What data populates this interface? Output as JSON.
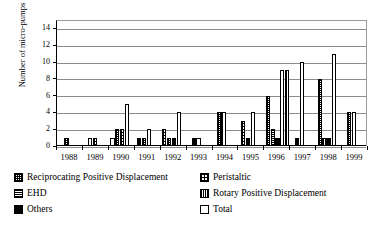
{
  "chart_data": {
    "type": "bar",
    "title": "",
    "xlabel": "",
    "ylabel": "Number of micro-pumps",
    "ylim": [
      0,
      15
    ],
    "yticks": [
      0,
      2,
      4,
      6,
      8,
      10,
      12,
      14
    ],
    "grid": true,
    "legend_position": "below",
    "categories": [
      "1988",
      "1989",
      "1990",
      "1991",
      "1992",
      "1993",
      "1994",
      "1995",
      "1996",
      "1997",
      "1998",
      "1999"
    ],
    "series": [
      {
        "name": "Reciprocating Positive Displacement",
        "key": "recip",
        "swatch": "checkered-light",
        "values": [
          1,
          1,
          2,
          1,
          2,
          1,
          4,
          4,
          6,
          10,
          8,
          4
        ]
      },
      {
        "name": "Peristaltic",
        "key": "peri",
        "swatch": "dotted",
        "values": [
          0,
          1,
          2,
          0,
          1,
          0,
          0,
          3,
          0,
          0,
          0,
          0
        ]
      },
      {
        "name": "EHD",
        "key": "ehd",
        "swatch": "dark-lines",
        "values": [
          0,
          0,
          0,
          0,
          0,
          0,
          0,
          0,
          2,
          9,
          1,
          0
        ]
      },
      {
        "name": "Rotary Positive Displacement",
        "key": "rotary",
        "swatch": "dark-dotted",
        "values": [
          0,
          0,
          0,
          0,
          0,
          0,
          0,
          0,
          1,
          9,
          1,
          0
        ]
      },
      {
        "name": "Others",
        "key": "others",
        "swatch": "solid-black",
        "values": [
          0,
          0,
          0,
          1,
          1,
          0,
          0,
          1,
          1,
          1,
          1,
          0
        ]
      },
      {
        "name": "Total",
        "key": "total",
        "swatch": "white",
        "values": [
          0,
          1,
          5,
          2,
          4,
          0,
          0,
          4,
          4,
          0,
          11,
          4
        ]
      }
    ],
    "bar_layout": [
      {
        "year": "1988",
        "bars": [
          {
            "series": "recip",
            "value": 1
          }
        ]
      },
      {
        "year": "1989",
        "bars": [
          {
            "series": "total",
            "value": 1
          },
          {
            "series": "peri",
            "value": 1
          }
        ]
      },
      {
        "year": "1990",
        "bars": [
          {
            "series": "total",
            "value": 1
          },
          {
            "series": "recip",
            "value": 2
          },
          {
            "series": "peri",
            "value": 2
          },
          {
            "series": "total",
            "value": 5
          }
        ]
      },
      {
        "year": "1991",
        "bars": [
          {
            "series": "others",
            "value": 1
          },
          {
            "series": "recip",
            "value": 1
          },
          {
            "series": "total",
            "value": 2
          }
        ]
      },
      {
        "year": "1992",
        "bars": [
          {
            "series": "peri",
            "value": 2
          },
          {
            "series": "recip",
            "value": 1
          },
          {
            "series": "others",
            "value": 1
          },
          {
            "series": "total",
            "value": 4
          }
        ]
      },
      {
        "year": "1993",
        "bars": [
          {
            "series": "others",
            "value": 1
          },
          {
            "series": "total",
            "value": 1
          }
        ]
      },
      {
        "year": "1994",
        "bars": [
          {
            "series": "recip",
            "value": 4
          },
          {
            "series": "total",
            "value": 4
          }
        ]
      },
      {
        "year": "1995",
        "bars": [
          {
            "series": "peri",
            "value": 3
          },
          {
            "series": "others",
            "value": 1
          },
          {
            "series": "total",
            "value": 4
          }
        ]
      },
      {
        "year": "1996",
        "bars": [
          {
            "series": "recip",
            "value": 6
          },
          {
            "series": "ehd",
            "value": 2
          },
          {
            "series": "others",
            "value": 1
          },
          {
            "series": "total",
            "value": 9
          },
          {
            "series": "rotary",
            "value": 9
          }
        ]
      },
      {
        "year": "1997",
        "bars": [
          {
            "series": "others",
            "value": 1
          },
          {
            "series": "total",
            "value": 10
          }
        ]
      },
      {
        "year": "1998",
        "bars": [
          {
            "series": "recip",
            "value": 8
          },
          {
            "series": "rotary",
            "value": 1
          },
          {
            "series": "others",
            "value": 1
          },
          {
            "series": "total",
            "value": 11
          }
        ]
      },
      {
        "year": "1999",
        "bars": [
          {
            "series": "recip",
            "value": 4
          },
          {
            "series": "total",
            "value": 4
          }
        ]
      }
    ]
  },
  "axis": {
    "ytick_labels": [
      "0",
      "2",
      "4",
      "6",
      "8",
      "10",
      "12",
      "14"
    ],
    "ylabel": "Number of micro-pumps",
    "xtick_labels": [
      "1988",
      "1989",
      "1990",
      "1991",
      "1992",
      "1993",
      "1994",
      "1995",
      "1996",
      "1997",
      "1998",
      "1999"
    ]
  },
  "legend": {
    "rows": [
      {
        "left": {
          "label": "Reciprocating Positive Displacement",
          "swatch": "recip"
        },
        "right": {
          "label": "Peristaltic",
          "swatch": "peri"
        }
      },
      {
        "left": {
          "label": "EHD",
          "swatch": "ehd"
        },
        "right": {
          "label": "Rotary Positive Displacement",
          "swatch": "rotary"
        }
      },
      {
        "left": {
          "label": "Others",
          "swatch": "others"
        },
        "right": {
          "label": "Total",
          "swatch": "total"
        }
      }
    ]
  },
  "colors": {
    "axis": "#000000",
    "grid": "#8c8c8c",
    "background": "#ffffff"
  }
}
